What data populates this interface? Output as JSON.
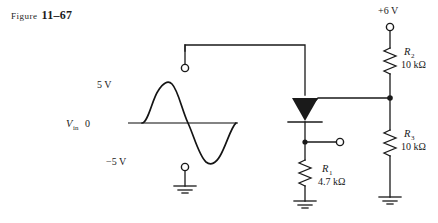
{
  "figure": {
    "caption_prefix": "Figure",
    "caption_number": "11–67"
  },
  "waveform": {
    "peak_label": "5 V",
    "zero_label": "0",
    "source_label": "V",
    "source_sub": "in",
    "trough_label": "−5 V"
  },
  "supply": {
    "label": "+6 V"
  },
  "components": [
    {
      "id": "R1",
      "ref": "R",
      "sub": "1",
      "value": "4.7 kΩ"
    },
    {
      "id": "R2",
      "ref": "R",
      "sub": "2",
      "value": "10 kΩ"
    },
    {
      "id": "R3",
      "ref": "R",
      "sub": "3",
      "value": "10 kΩ"
    }
  ],
  "symbols": {
    "scr": "scr-thyristor",
    "ground": "ground",
    "terminal": "open-terminal",
    "junction": "junction-dot"
  },
  "colors": {
    "ink": "#1a1a1a",
    "axis": "#5a5a5a",
    "paper": "#ffffff"
  }
}
